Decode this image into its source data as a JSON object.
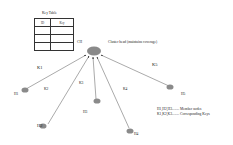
{
  "table": {
    "title": "Key Table",
    "headers": [
      "ID",
      "Key"
    ],
    "rows": [
      [
        "",
        ""
      ],
      [
        "",
        ""
      ],
      [
        "",
        ""
      ]
    ]
  },
  "cluster_head": {
    "label": "CH",
    "description": "Cluster head (maintains coverage)"
  },
  "nodes": [
    {
      "id": "H1",
      "key": "K1"
    },
    {
      "id": "H2",
      "key": "K2"
    },
    {
      "id": "H3",
      "key": "K3"
    },
    {
      "id": "H4",
      "key": "K4"
    },
    {
      "id": "H5",
      "key": "K5"
    }
  ],
  "legend": {
    "line1": "H1,H2,H3........ Member nodes",
    "line2": "K1,K2,K3........ Corresponding Keys"
  },
  "colors": {
    "node": "#8a8a8a",
    "edge": "#555555"
  }
}
